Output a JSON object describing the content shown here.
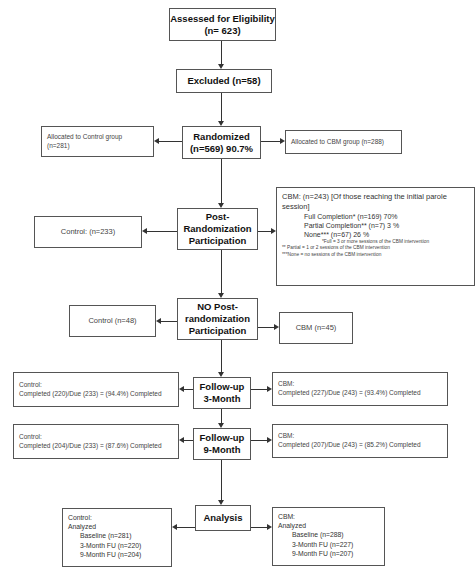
{
  "flowchart": {
    "assessed": {
      "line1": "Assessed for Eligibility",
      "line2": "(n= 623)"
    },
    "excluded": {
      "label": "Excluded (n=58)"
    },
    "randomized": {
      "line1": "Randomized",
      "line2": "(n=569) 90.7%"
    },
    "allocated_control": {
      "line1": "Allocated to Control group",
      "line2": "(n=281)"
    },
    "allocated_cbm": {
      "label": "Allocated to CBM group (n=288)"
    },
    "post_randomization": {
      "line1": "Post-",
      "line2": "Randomization",
      "line3": "Participation"
    },
    "post_control": {
      "label": "Control: (n=233)"
    },
    "post_cbm": {
      "header": "CBM: (n=243) [Of those reaching the initial parole session]",
      "full": "Full Completion* (n=169) 70%",
      "partial": "Partial Completion** (n=7) 3 %",
      "none": "None*** (n=67) 26 %",
      "note_full": "*Full = 3 or more sessions of the CBM intervention",
      "note_partial": "** Partial = 1 or 2 sessions of the CBM intervention",
      "note_none": "***None = no sessions of the CBM intervention"
    },
    "no_post": {
      "line1": "NO Post-",
      "line2": "randomization",
      "line3": "Participation"
    },
    "no_post_control": {
      "label": "Control (n=48)"
    },
    "no_post_cbm": {
      "label": "CBM (n=45)"
    },
    "followup_3": {
      "line1": "Follow-up",
      "line2": "3-Month"
    },
    "followup_3_control": {
      "line1": "Control:",
      "line2": "Completed (220)/Due (233) = (94.4%) Completed"
    },
    "followup_3_cbm": {
      "line1": "CBM:",
      "line2": "Completed (227)/Due (243) = (93.4%) Completed"
    },
    "followup_9": {
      "line1": "Follow-up",
      "line2": "9-Month"
    },
    "followup_9_control": {
      "line1": "Control:",
      "line2": "Completed (204)/Due (233) = (87.6%) Completed"
    },
    "followup_9_cbm": {
      "line1": "CBM:",
      "line2": "Completed (207)/Due (243) = (85.2%) Completed"
    },
    "analysis": {
      "label": "Analysis"
    },
    "analysis_control": {
      "group": "Control:",
      "analyzed": "Analyzed",
      "baseline": "Baseline (n=281)",
      "month3": "3-Month FU (n=220)",
      "month9": "9-Month FU (n=204)"
    },
    "analysis_cbm": {
      "group": "CBM:",
      "analyzed": "Analyzed",
      "baseline": "Baseline (n=288)",
      "month3": "3-Month FU (n=227)",
      "month9": "9-Month FU (n=207)"
    }
  }
}
